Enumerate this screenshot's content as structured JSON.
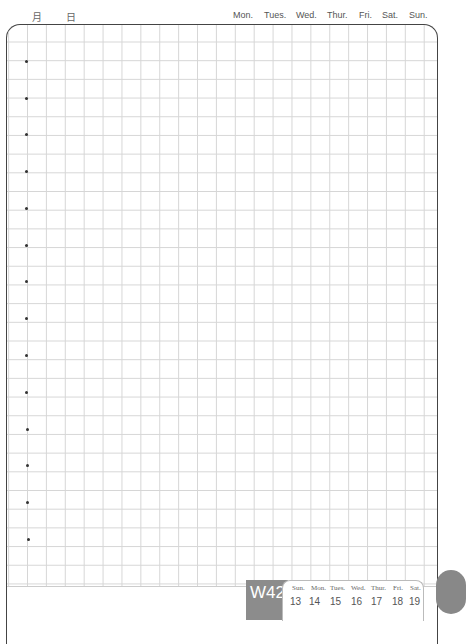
{
  "header": {
    "month_label": "月",
    "day_label": "日",
    "weekdays": [
      "Mon.",
      "Tues.",
      "Wed.",
      "Thur.",
      "Fri.",
      "Sat.",
      "Sun."
    ]
  },
  "footer": {
    "week_label": "W42",
    "days": [
      "Sun.",
      "Mon.",
      "Tues.",
      "Wed.",
      "Thur.",
      "Fri.",
      "Sat."
    ],
    "dates": [
      "13",
      "14",
      "15",
      "16",
      "17",
      "18",
      "19"
    ]
  },
  "colors": {
    "border": "#444444",
    "grid": "#d6d6d6",
    "week_badge": "#8c8c8c"
  }
}
